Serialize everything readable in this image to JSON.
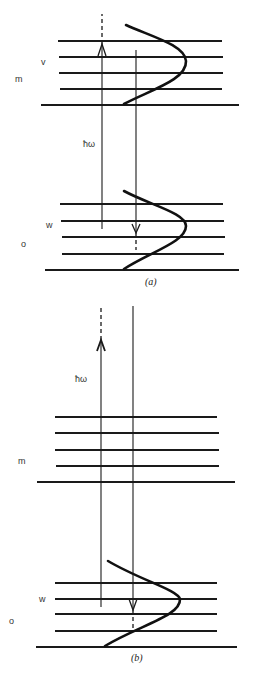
{
  "figure": {
    "type": "energy-level-diagram",
    "panels": [
      {
        "caption": "(a)",
        "caption_pos": [
          145,
          285
        ],
        "upper_levels": [
          {
            "y": 41,
            "x1": 58,
            "x2": 222
          },
          {
            "y": 57,
            "x1": 59,
            "x2": 223
          },
          {
            "y": 73,
            "x1": 59,
            "x2": 223
          },
          {
            "y": 89,
            "x1": 60,
            "x2": 222
          },
          {
            "y": 105,
            "x1": 41,
            "x2": 239
          }
        ],
        "lower_levels": [
          {
            "y": 204,
            "x1": 60,
            "x2": 223
          },
          {
            "y": 221,
            "x1": 61,
            "x2": 224
          },
          {
            "y": 237,
            "x1": 62,
            "x2": 225
          },
          {
            "y": 254,
            "x1": 62,
            "x2": 224
          },
          {
            "y": 270,
            "x1": 45,
            "x2": 239
          }
        ],
        "up_arrow": {
          "x": 102,
          "y_bottom": 229,
          "y_head": 44,
          "dash_top": 14,
          "head": "open"
        },
        "down_arrow": {
          "x": 136,
          "y_top": 50,
          "y_head": 91,
          "y_band_top": 204,
          "dash_bottom": 110,
          "head": "open"
        },
        "upper_curve": "M126,25 C150,36 185,45 186,61 C187,80 150,90 124,104",
        "lower_curve": "M124,191 C150,205 186,213 186,226 C186,242 150,252 124,269",
        "labels": [
          {
            "text": "v",
            "x": 41,
            "y": 65
          },
          {
            "text": "m",
            "x": 15,
            "y": 82
          },
          {
            "text": "ħω",
            "x": 83,
            "y": 147
          },
          {
            "text": "w",
            "x": 46,
            "y": 228
          },
          {
            "text": "o",
            "x": 21,
            "y": 247
          }
        ]
      },
      {
        "caption": "(b)",
        "caption_pos": [
          131,
          661
        ],
        "upper_levels": [
          {
            "y": 417,
            "x1": 55,
            "x2": 217
          },
          {
            "y": 433,
            "x1": 55,
            "x2": 219
          },
          {
            "y": 450,
            "x1": 55,
            "x2": 219
          },
          {
            "y": 466,
            "x1": 56,
            "x2": 219
          },
          {
            "y": 482,
            "x1": 37,
            "x2": 235
          }
        ],
        "lower_levels": [
          {
            "y": 583,
            "x1": 55,
            "x2": 217
          },
          {
            "y": 599,
            "x1": 55,
            "x2": 217
          },
          {
            "y": 614,
            "x1": 55,
            "x2": 217
          },
          {
            "y": 631,
            "x1": 55,
            "x2": 217
          },
          {
            "y": 647,
            "x1": 36,
            "x2": 237
          }
        ],
        "up_arrow": {
          "x": 101,
          "y_bottom": 607,
          "y_head": 340,
          "dash_top": 305,
          "head": "filled-line"
        },
        "down_arrow": {
          "x": 133,
          "y_top": 306,
          "y_head": 610,
          "y_band_top": 583,
          "dash_bottom": 631,
          "head": "open"
        },
        "lower_curve": "M108,561 C140,580 178,590 180,599 C181,616 140,625 105,646",
        "labels": [
          {
            "text": "ħω",
            "x": 75,
            "y": 382
          },
          {
            "text": "m",
            "x": 18,
            "y": 464
          },
          {
            "text": "w",
            "x": 39,
            "y": 602
          },
          {
            "text": "o",
            "x": 9,
            "y": 624
          }
        ]
      }
    ]
  }
}
